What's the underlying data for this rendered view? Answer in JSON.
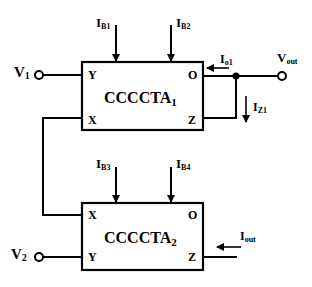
{
  "diagram": {
    "type": "circuit-schematic",
    "blocks": [
      {
        "id": "block1",
        "name": "CCCCTA",
        "subscript": "1",
        "ports": {
          "top_left": "Y",
          "bottom_left": "X",
          "top_right": "O",
          "bottom_right": "Z"
        }
      },
      {
        "id": "block2",
        "name": "CCCCTA",
        "subscript": "2",
        "ports": {
          "top_left": "X",
          "bottom_left": "Y",
          "top_right": "O",
          "bottom_right": "Z"
        }
      }
    ],
    "inputs": {
      "v1": {
        "main": "V",
        "sub": "1"
      },
      "v2": {
        "main": "V",
        "sub": "2"
      }
    },
    "output": {
      "main": "V",
      "sub": "out"
    },
    "bias_currents": [
      {
        "main": "I",
        "sub": "B1"
      },
      {
        "main": "I",
        "sub": "B2"
      },
      {
        "main": "I",
        "sub": "B3"
      },
      {
        "main": "I",
        "sub": "B4"
      }
    ],
    "currents": {
      "io1": {
        "main": "I",
        "sub": "o1"
      },
      "iz1": {
        "main": "I",
        "sub": "Z1"
      },
      "iout": {
        "main": "I",
        "sub": "out"
      }
    },
    "colors": {
      "stroke": "#000000",
      "background": "#ffffff"
    }
  }
}
